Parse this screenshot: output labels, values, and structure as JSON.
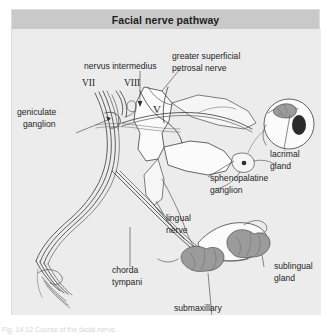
{
  "figure": {
    "title": "Facial nerve pathway",
    "caption": "Fig. 14.12 Course of the facial nerve.",
    "colors": {
      "page_background": "#ffffff",
      "frame_background": "#e9e9e9",
      "title_bar": "#c9c9c9",
      "canvas_background": "#ececec",
      "ink": "#3a3a3a",
      "gland_fill": "#9a9a9a",
      "structure_fill": "#fbfbfb",
      "label_text": "#242424"
    }
  },
  "labels": {
    "nervus_intermedius": "nervus intermedius",
    "cranial_vii": "VII",
    "cranial_viii": "VIII",
    "geniculate_ganglion_l1": "geniculate",
    "geniculate_ganglion_l2": "ganglion",
    "greater_petrosal_l1": "greater superficial",
    "greater_petrosal_l2": "petrosal nerve",
    "trigeminal_v": "V",
    "lacrimal_gland_l1": "lacrimal",
    "lacrimal_gland_l2": "gland",
    "sphenopalatine_l1": "sphenopalatine",
    "sphenopalatine_l2": "ganglion",
    "lingual_nerve_l1": "lingual",
    "lingual_nerve_l2": "nerve",
    "chorda_tympani_l1": "chorda",
    "chorda_tympani_l2": "tympani",
    "sublingual_gland_l1": "sublingual",
    "sublingual_gland_l2": "gland",
    "submaxillary_gland_l1": "submaxillary",
    "submaxillary_gland_l2": "gland"
  },
  "structures": [
    {
      "name": "facial-nerve-trunk",
      "kind": "nerve-bundle"
    },
    {
      "name": "nervus-intermedius",
      "kind": "nerve"
    },
    {
      "name": "vestibulocochlear-nerve",
      "kind": "nerve"
    },
    {
      "name": "geniculate-ganglion",
      "kind": "ganglion"
    },
    {
      "name": "greater-superficial-petrosal-nerve",
      "kind": "nerve"
    },
    {
      "name": "trigeminal-nerve",
      "kind": "nerve"
    },
    {
      "name": "lacrimal-gland",
      "kind": "gland"
    },
    {
      "name": "sphenopalatine-ganglion",
      "kind": "ganglion"
    },
    {
      "name": "lingual-nerve",
      "kind": "nerve"
    },
    {
      "name": "chorda-tympani",
      "kind": "nerve"
    },
    {
      "name": "sublingual-gland",
      "kind": "gland"
    },
    {
      "name": "submaxillary-gland",
      "kind": "gland"
    },
    {
      "name": "terminal-facial-branches",
      "kind": "nerve-fan"
    }
  ]
}
